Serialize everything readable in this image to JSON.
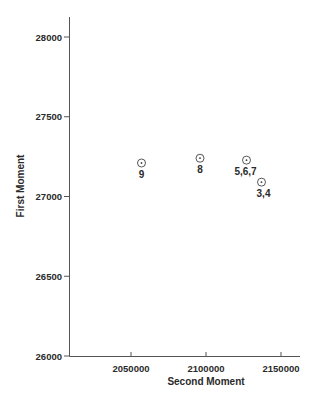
{
  "chart_data": {
    "type": "scatter",
    "title": "",
    "xlabel": "Second Moment",
    "ylabel": "First Moment",
    "xlim": [
      2000000,
      2162000
    ],
    "ylim": [
      26000,
      28125
    ],
    "xticks": [
      2050000,
      2100000,
      2150000
    ],
    "xtick_labels": [
      "2050000",
      "2100000",
      "2150000"
    ],
    "yticks": [
      26000,
      26500,
      27000,
      27500,
      28000
    ],
    "ytick_labels": [
      "26000",
      "26500",
      "27000",
      "27500",
      "28000"
    ],
    "grid": false,
    "legend": null,
    "marker": "circle-dot",
    "points": [
      {
        "label": "9",
        "x": 2057000,
        "y": 27210
      },
      {
        "label": "8",
        "x": 2096000,
        "y": 27240
      },
      {
        "label": "5,6,7",
        "x": 2127000,
        "y": 27228
      },
      {
        "label": "3,4",
        "x": 2137000,
        "y": 27090
      }
    ]
  }
}
